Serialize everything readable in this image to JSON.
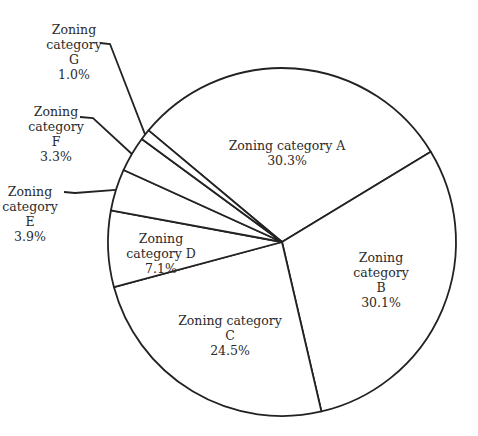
{
  "chart_data": {
    "type": "pie",
    "title": "",
    "start_bearing_deg": 309.9,
    "direction": "clockwise",
    "categories": [
      "Zoning category A",
      "Zoning category B",
      "Zoning category C",
      "Zoning category D",
      "Zoning category E",
      "Zoning category F",
      "Zoning category G"
    ],
    "values": [
      30.3,
      30.1,
      24.5,
      7.1,
      3.9,
      3.3,
      1.0
    ],
    "unit": "%",
    "legend": "none (direct labels)",
    "labels": [
      {
        "lines": [
          "Zoning category A",
          "30.3%"
        ],
        "placement": "inside"
      },
      {
        "lines": [
          "Zoning",
          "category",
          "B",
          "30.1%"
        ],
        "placement": "inside"
      },
      {
        "lines": [
          "Zoning category",
          "C",
          "24.5%"
        ],
        "placement": "inside"
      },
      {
        "lines": [
          "Zoning",
          "category D",
          "7.1%"
        ],
        "placement": "inside"
      },
      {
        "lines": [
          "Zoning",
          "category",
          "E",
          "3.9%"
        ],
        "placement": "outside-leader"
      },
      {
        "lines": [
          "Zoning",
          "category",
          "F",
          "3.3%"
        ],
        "placement": "outside-leader"
      },
      {
        "lines": [
          "Zoning",
          "category",
          "G",
          "1.0%"
        ],
        "placement": "outside-leader"
      }
    ]
  },
  "style": {
    "stroke": "#222222",
    "fill": "#ffffff",
    "text": "#2b2b2b"
  }
}
